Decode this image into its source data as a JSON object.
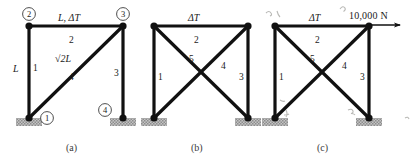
{
  "figure": {
    "background_color": "#ffffff",
    "line_color": "#111111",
    "support_fill": "#b9b9b9",
    "width": 414,
    "height": 165
  },
  "panels": [
    {
      "id": "a",
      "caption": "(a)",
      "nodes": [
        {
          "label": "1",
          "circled": true
        },
        {
          "label": "2",
          "circled": true
        },
        {
          "label": "3",
          "circled": true
        },
        {
          "label": "4",
          "circled": true
        }
      ],
      "members": [
        {
          "number": "1",
          "dimension": "L"
        },
        {
          "number": "2",
          "dimension": "L, ΔT"
        },
        {
          "number": "3",
          "dimension": ""
        },
        {
          "number": "4",
          "dimension": "√2L"
        }
      ],
      "labels": {
        "top_chord": "L, ΔT",
        "left_vertical": "L",
        "diagonal": "√2L",
        "member_1": "1",
        "member_2": "2",
        "member_3": "3",
        "member_4": "4",
        "node_1": "1",
        "node_2": "2",
        "node_3": "3",
        "node_4": "4"
      }
    },
    {
      "id": "b",
      "caption": "(b)",
      "members": [
        {
          "number": "1"
        },
        {
          "number": "2"
        },
        {
          "number": "3"
        },
        {
          "number": "4"
        },
        {
          "number": "5"
        }
      ],
      "labels": {
        "top_chord": "ΔT",
        "member_1": "1",
        "member_2": "2",
        "member_3": "3",
        "member_4": "4",
        "member_5": "5"
      }
    },
    {
      "id": "c",
      "caption": "(c)",
      "members": [
        {
          "number": "1"
        },
        {
          "number": "2"
        },
        {
          "number": "3"
        },
        {
          "number": "4"
        },
        {
          "number": "5"
        }
      ],
      "labels": {
        "top_chord": "ΔT",
        "member_1": "1",
        "member_2": "2",
        "member_3": "3",
        "member_4": "4",
        "member_5": "5",
        "applied_force": "10,000 N"
      }
    }
  ],
  "annotations": {
    "pencil_marks": [
      "⌐",
      "⌐",
      "ι",
      "ι",
      "˜",
      "˜"
    ]
  }
}
